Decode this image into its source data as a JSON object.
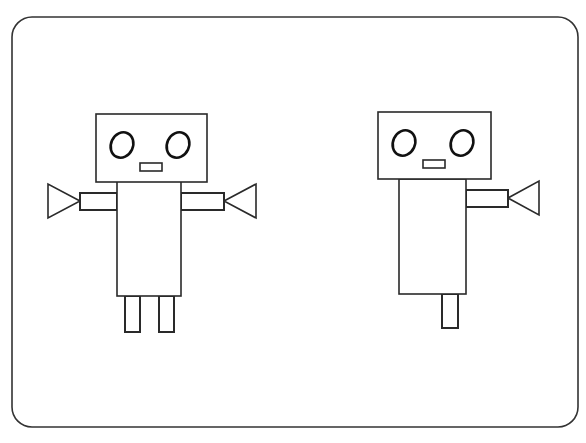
{
  "canvas": {
    "width": 586,
    "height": 443,
    "background": "#ffffff",
    "stroke": "#2a2a2a"
  },
  "frame": {
    "x": 12,
    "y": 17,
    "width": 566,
    "height": 410,
    "radius": 20
  },
  "robots": [
    {
      "name": "robot-left",
      "head": {
        "x": 96,
        "y": 114,
        "w": 111,
        "h": 68
      },
      "eyes": [
        {
          "cx": 122,
          "cy": 145,
          "rx": 11,
          "ry": 13
        },
        {
          "cx": 178,
          "cy": 145,
          "rx": 11,
          "ry": 13
        }
      ],
      "mouth": {
        "x": 140,
        "y": 163,
        "w": 22,
        "h": 8
      },
      "body": {
        "x": 117,
        "y": 181,
        "w": 64,
        "h": 115
      },
      "arms": [
        {
          "side": "left",
          "x": 80,
          "y": 193,
          "w": 37,
          "h": 17,
          "tri": "80,201 48,184 48,218"
        },
        {
          "side": "right",
          "x": 181,
          "y": 193,
          "w": 43,
          "h": 17,
          "tri": "224,201 256,184 256,218"
        }
      ],
      "legs": [
        {
          "x": 125,
          "y": 296,
          "w": 15,
          "h": 36
        },
        {
          "x": 159,
          "y": 296,
          "w": 15,
          "h": 36
        }
      ]
    },
    {
      "name": "robot-right",
      "head": {
        "x": 378,
        "y": 112,
        "w": 113,
        "h": 67
      },
      "eyes": [
        {
          "cx": 404,
          "cy": 143,
          "rx": 11,
          "ry": 13
        },
        {
          "cx": 462,
          "cy": 143,
          "rx": 11,
          "ry": 13
        }
      ],
      "mouth": {
        "x": 423,
        "y": 160,
        "w": 22,
        "h": 8
      },
      "body": {
        "x": 399,
        "y": 179,
        "w": 67,
        "h": 115
      },
      "arms": [
        {
          "side": "right",
          "x": 466,
          "y": 190,
          "w": 42,
          "h": 17,
          "tri": "508,198 539,181 539,215"
        }
      ],
      "legs": [
        {
          "x": 442,
          "y": 294,
          "w": 16,
          "h": 34
        }
      ]
    }
  ]
}
